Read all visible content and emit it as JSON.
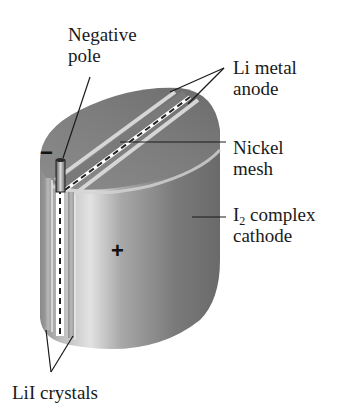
{
  "figure": {
    "labels": {
      "negative_pole": [
        "Negative",
        "pole"
      ],
      "li_metal_anode": [
        "Li metal",
        "anode"
      ],
      "nickel_mesh": [
        "Nickel",
        "mesh"
      ],
      "cathode": {
        "line1_main": "I",
        "line1_sub": "2",
        "line1_rest": " complex",
        "line2": "cathode"
      },
      "lii_crystals": "LiI crystals"
    },
    "symbols": {
      "negative": "−",
      "positive": "+"
    },
    "colors": {
      "body_dark": "#6e6e6e",
      "body_mid": "#9a9a9a",
      "body_light": "#cfcfcf",
      "stripe_light": "#dcdcdc",
      "leader_line": "#1a1a1a",
      "background": "#ffffff"
    }
  }
}
